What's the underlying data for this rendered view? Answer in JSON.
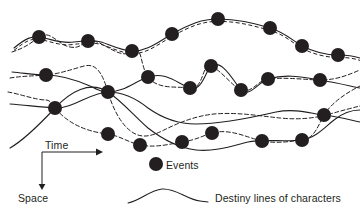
{
  "figure": {
    "background_color": "#ffffff",
    "ink_color": "#231f20",
    "width": 360,
    "height": 219
  },
  "axes": {
    "time": {
      "label": "Time",
      "direction": "horizontal-right",
      "arrow": true
    },
    "space": {
      "label": "Space",
      "direction": "vertical-down",
      "arrow": true
    },
    "origin": {
      "x": 42,
      "y": 152
    },
    "time_end": {
      "x": 100,
      "y": 152
    },
    "space_end": {
      "x": 42,
      "y": 188
    }
  },
  "legend": {
    "items": [
      {
        "icon": "filled-circle",
        "label": "Events"
      },
      {
        "icon": "curve-squiggle",
        "label": "Destiny lines of characters"
      }
    ],
    "event_swatch": {
      "cx": 156,
      "cy": 164,
      "r": 7
    },
    "curve_swatch": {
      "x": 128,
      "y": 197,
      "width": 80
    }
  },
  "chart_data": {
    "type": "scatter",
    "title": "",
    "xlabel": "Time",
    "ylabel": "Space",
    "grid": false,
    "legend_position": "bottom-center",
    "node_radius": 7,
    "events": [
      {
        "id": "e1",
        "x": 39,
        "y": 37
      },
      {
        "id": "e2",
        "x": 88,
        "y": 41
      },
      {
        "id": "e3",
        "x": 132,
        "y": 51
      },
      {
        "id": "e4",
        "x": 172,
        "y": 34
      },
      {
        "id": "e5",
        "x": 218,
        "y": 19
      },
      {
        "id": "e6",
        "x": 270,
        "y": 28
      },
      {
        "id": "e7",
        "x": 302,
        "y": 46
      },
      {
        "id": "e8",
        "x": 338,
        "y": 55
      },
      {
        "id": "e9",
        "x": 46,
        "y": 75
      },
      {
        "id": "e10",
        "x": 108,
        "y": 92
      },
      {
        "id": "e11",
        "x": 148,
        "y": 77
      },
      {
        "id": "e12",
        "x": 190,
        "y": 88
      },
      {
        "id": "e13",
        "x": 211,
        "y": 66
      },
      {
        "id": "e14",
        "x": 241,
        "y": 90
      },
      {
        "id": "e15",
        "x": 268,
        "y": 79
      },
      {
        "id": "e16",
        "x": 320,
        "y": 80
      },
      {
        "id": "e17",
        "x": 55,
        "y": 108
      },
      {
        "id": "e18",
        "x": 324,
        "y": 115
      },
      {
        "id": "e19",
        "x": 108,
        "y": 134
      },
      {
        "id": "e20",
        "x": 140,
        "y": 145
      },
      {
        "id": "e21",
        "x": 182,
        "y": 142
      },
      {
        "id": "e22",
        "x": 212,
        "y": 133
      },
      {
        "id": "e23",
        "x": 262,
        "y": 141
      },
      {
        "id": "e24",
        "x": 302,
        "y": 140
      }
    ],
    "destiny_lines": [
      {
        "id": "line-1",
        "style": "solid-with-dashed-shadow",
        "path": "M 14,48 C 26,38 32,36 39,37 C 52,39 60,44 74,42 C 82,41 84,41 88,41 C 104,39 114,50 132,51 C 146,52 158,42 172,34 C 190,24 202,19 218,19 C 238,19 252,23 270,28 C 284,32 292,40 302,46 C 314,52 326,55 338,55 C 348,55 354,56 360,58"
      },
      {
        "id": "line-2",
        "style": "solid",
        "path": "M 12,72 C 24,73 36,75 46,75 C 62,75 76,80 90,86 C 98,90 102,92 108,92 C 124,92 134,82 148,77 C 166,71 178,84 190,88 C 202,92 206,70 211,66 C 222,58 234,82 241,90 C 250,98 258,82 268,79 C 288,73 306,78 320,80 C 338,83 350,86 360,88"
      },
      {
        "id": "line-3",
        "style": "dashed",
        "path": "M 12,52 C 24,48 30,44 39,37 C 50,29 58,45 70,47 C 80,49 82,43 88,41 C 100,37 120,62 132,51 C 142,42 140,66 148,77 C 158,90 176,86 190,88 C 204,90 202,62 211,66 C 222,71 232,86 241,90 C 252,94 258,80 268,79 C 288,77 308,80 320,80 C 338,80 350,74 360,70"
      },
      {
        "id": "line-4",
        "style": "solid",
        "path": "M 10,104 C 24,105 40,107 55,108 C 72,109 92,92 108,92 C 124,92 138,100 148,108 C 162,118 178,124 196,124 C 222,124 250,118 276,112 C 296,108 312,114 324,115 C 340,117 350,120 360,122"
      },
      {
        "id": "line-5",
        "style": "dashed",
        "path": "M 8,92 C 20,94 36,100 46,100 C 50,100 52,104 55,108 C 70,126 90,132 108,134 C 120,136 130,143 140,145 C 156,148 170,144 182,142 C 196,140 202,136 212,133 C 230,128 248,138 262,141 C 278,144 292,141 302,140 C 314,139 318,126 324,115 C 332,102 348,92 360,86"
      },
      {
        "id": "line-6",
        "style": "solid",
        "path": "M 10,148 C 24,140 40,124 55,108 C 70,92 90,80 108,92 C 122,101 136,118 148,128 C 166,142 180,148 196,150 C 214,152 232,146 248,142 C 262,139 286,142 302,140 C 316,138 326,126 334,120 C 344,112 352,110 360,110"
      },
      {
        "id": "line-7",
        "style": "dashed",
        "path": "M 10,78 C 22,76 34,76 46,75 C 58,74 70,70 84,66 C 96,63 102,72 108,92 C 112,106 120,124 132,132 C 142,139 152,136 164,130 C 180,122 196,116 214,114 C 238,112 260,116 280,118 C 300,120 316,118 330,114 C 344,110 352,108 360,106"
      }
    ]
  }
}
